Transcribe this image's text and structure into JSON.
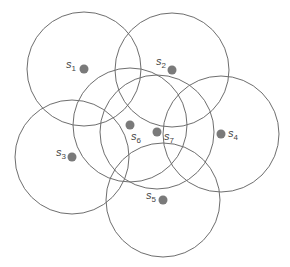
{
  "diagram": {
    "title": "",
    "colors": {
      "circle_stroke": "#6e6e6e",
      "node_fill": "#7a7a7a",
      "label": "#444444"
    },
    "sensors": [
      {
        "id": "s1",
        "label_base": "s",
        "label_sub": "1",
        "cx": 84,
        "cy": 69,
        "r": 57,
        "lx": 66,
        "ly": 68,
        "label_side": "left"
      },
      {
        "id": "s2",
        "label_base": "s",
        "label_sub": "2",
        "cx": 172,
        "cy": 70,
        "r": 57,
        "lx": 156,
        "ly": 65,
        "label_side": "left"
      },
      {
        "id": "s3",
        "label_base": "s",
        "label_sub": "3",
        "cx": 72,
        "cy": 157,
        "r": 57,
        "lx": 56,
        "ly": 156,
        "label_side": "left"
      },
      {
        "id": "s4",
        "label_base": "s",
        "label_sub": "4",
        "cx": 221,
        "cy": 134,
        "r": 58,
        "lx": 228,
        "ly": 137,
        "label_side": "right"
      },
      {
        "id": "s5",
        "label_base": "s",
        "label_sub": "5",
        "cx": 163,
        "cy": 200,
        "r": 57,
        "lx": 146,
        "ly": 199,
        "label_side": "left"
      },
      {
        "id": "s6",
        "label_base": "s",
        "label_sub": "6",
        "cx": 130,
        "cy": 125,
        "r": 57,
        "lx": 131,
        "ly": 140,
        "label_side": "below-right"
      },
      {
        "id": "s7",
        "label_base": "s",
        "label_sub": "7",
        "cx": 157,
        "cy": 132,
        "r": 57,
        "lx": 164,
        "ly": 140,
        "label_side": "right"
      }
    ]
  }
}
